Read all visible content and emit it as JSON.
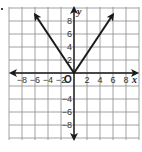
{
  "chart_data": {
    "type": "line",
    "title": "",
    "xlabel": "x",
    "ylabel": "y",
    "origin_label": "O",
    "xlim": [
      -10,
      10
    ],
    "ylim": [
      -10,
      10
    ],
    "grid": true,
    "grid_step": 2,
    "x_ticks": [
      -8,
      -6,
      -4,
      -2,
      2,
      4,
      6,
      8
    ],
    "x_tick_labels": [
      "−8",
      "−6",
      "−4",
      "−2",
      "2",
      "4",
      "6",
      "8"
    ],
    "y_ticks": [
      8,
      6,
      4,
      2,
      -4,
      -6,
      -8
    ],
    "y_tick_labels": [
      "8",
      "6",
      "4",
      "2",
      "−4",
      "−6",
      "−8"
    ],
    "series": [
      {
        "name": "y = 1.5|x|",
        "x": [
          -6,
          0,
          6
        ],
        "y": [
          9,
          0,
          9
        ],
        "arrows": "both-ends",
        "color": "#1a1a1a"
      }
    ],
    "axis_color": "#1a1a1a",
    "grid_color": "#8a8a8a"
  }
}
